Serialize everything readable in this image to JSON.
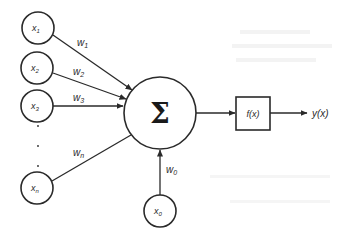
{
  "diagram": {
    "inputs": [
      {
        "id": "x1",
        "label": "x",
        "sub": "1",
        "weight": "w",
        "weight_sub": "1",
        "cx": 38,
        "cy": 28
      },
      {
        "id": "x2",
        "label": "x",
        "sub": "2",
        "weight": "w",
        "weight_sub": "2",
        "cx": 37,
        "cy": 68
      },
      {
        "id": "x3",
        "label": "x",
        "sub": "3",
        "weight": "w",
        "weight_sub": "3",
        "cx": 37,
        "cy": 106
      },
      {
        "id": "xn",
        "label": "x",
        "sub": "n",
        "weight": "w",
        "weight_sub": "n",
        "cx": 37,
        "cy": 188
      }
    ],
    "bias": {
      "id": "x0",
      "label": "x",
      "sub": "0",
      "weight": "w",
      "weight_sub": "0",
      "cx": 160,
      "cy": 211
    },
    "ellipsis": "·",
    "summation": {
      "symbol": "Σ",
      "cx": 160,
      "cy": 113,
      "r": 36
    },
    "activation": {
      "label": "f(x)"
    },
    "output": {
      "label": "y(x)"
    },
    "colors": {
      "stroke": "#2a2a2a",
      "background": "#ffffff"
    }
  }
}
